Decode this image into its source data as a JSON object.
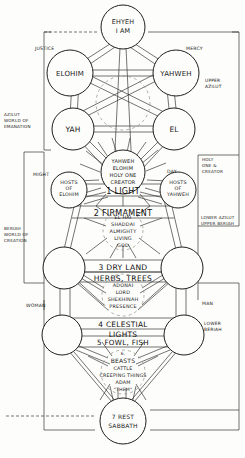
{
  "diagram": {
    "ink": "#1a1a1a",
    "paper": "#fdfdfb"
  },
  "nodes": {
    "keter": {
      "lines": [
        "EHYEH",
        "I AM"
      ]
    },
    "binah": {
      "lines": [
        "ELOHIM"
      ]
    },
    "hokhmah": {
      "lines": [
        "YAHWEH"
      ]
    },
    "gevurah_up": {
      "lines": [
        "YAH"
      ]
    },
    "hesed_up": {
      "lines": [
        "EL"
      ]
    },
    "tiferet": {
      "lines": [
        "YAHWEH",
        "ELOHIM",
        "HOLY ONE",
        "CREATOR"
      ]
    },
    "hod": {
      "lines": [
        "HOSTS",
        "OF",
        "ELOHIM"
      ]
    },
    "netzah": {
      "lines": [
        "HOSTS",
        "OF",
        "YAHWEH"
      ]
    },
    "yesod": {
      "lines": [
        "EL HAI",
        "SHADDAI",
        "ALMIGHTY",
        "LIVING",
        "GOD"
      ]
    },
    "malkhut": {
      "lines": [
        "ADONAI",
        "LORD",
        "SHEKHINAH",
        "PRESENCE"
      ]
    },
    "beasts": {
      "lines": [
        "6.",
        "BEASTS",
        "CATTLE",
        "CREEPING THINGS",
        "ADAM",
        "\"THEM\""
      ]
    },
    "sabbath": {
      "lines": [
        "7 REST",
        "SABBATH"
      ]
    },
    "left_mid": {
      "lines": []
    },
    "right_mid": {
      "lines": []
    },
    "left_low": {
      "lines": []
    },
    "right_low": {
      "lines": []
    }
  },
  "bands": [
    {
      "id": "band-1",
      "text": "1 LIGHT"
    },
    {
      "id": "band-2",
      "text": "2 FIRMAMENT"
    },
    {
      "id": "band-3",
      "text": "3 DRY LAND"
    },
    {
      "id": "band-3b",
      "text": "HERBS, TREES"
    },
    {
      "id": "band-4",
      "text": "4 CELESTIAL"
    },
    {
      "id": "band-4b",
      "text": "LIGHTS"
    },
    {
      "id": "band-5",
      "text": "5 FOWL, FISH"
    }
  ],
  "side_labels": {
    "justice": "JUSTICE",
    "mercy": "MERCY",
    "might": "MIGHT",
    "day": "DAY",
    "woman": "WOMAN",
    "man": "MAN"
  },
  "world_labels": {
    "upper_azilut": [
      "UPPER",
      "AZILUT"
    ],
    "azilut_world": [
      "AZILUT",
      "WORLD OF",
      "EMANATION"
    ],
    "holy_one_creator": [
      "HOLY",
      "ONE &",
      "CREATOR"
    ],
    "lower_azilut_upper_beriah": [
      "LOWER AZILUT",
      "UPPER BERIAH"
    ],
    "beriah_world": [
      "BERIAH",
      "WORLD OF",
      "CREATION"
    ],
    "lower_beriah": [
      "LOWER",
      "BERIAH"
    ]
  }
}
